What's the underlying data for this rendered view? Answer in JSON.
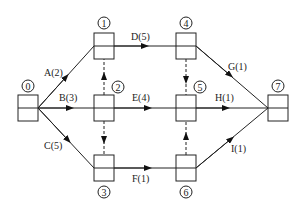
{
  "diagram": {
    "type": "activity-on-node network",
    "nodes": [
      {
        "id": "0",
        "label": "0",
        "x": 18,
        "y": 95
      },
      {
        "id": "1",
        "label": "1",
        "x": 94,
        "y": 33
      },
      {
        "id": "2",
        "label": "2",
        "x": 94,
        "y": 95
      },
      {
        "id": "3",
        "label": "3",
        "x": 94,
        "y": 155
      },
      {
        "id": "4",
        "label": "4",
        "x": 176,
        "y": 33
      },
      {
        "id": "5",
        "label": "5",
        "x": 176,
        "y": 95
      },
      {
        "id": "6",
        "label": "6",
        "x": 176,
        "y": 155
      },
      {
        "id": "7",
        "label": "7",
        "x": 268,
        "y": 95
      }
    ],
    "activities": [
      {
        "label": "A(2)",
        "from": "0",
        "to": "1"
      },
      {
        "label": "B(3)",
        "from": "0",
        "to": "2"
      },
      {
        "label": "C(5)",
        "from": "0",
        "to": "3"
      },
      {
        "label": "D(5)",
        "from": "1",
        "to": "4"
      },
      {
        "label": "E(4)",
        "from": "2",
        "to": "5"
      },
      {
        "label": "F(1)",
        "from": "3",
        "to": "6"
      },
      {
        "label": "G(1)",
        "from": "4",
        "to": "7"
      },
      {
        "label": "H(1)",
        "from": "5",
        "to": "7"
      },
      {
        "label": "I(1)",
        "from": "6",
        "to": "7"
      }
    ],
    "dummies": [
      {
        "from": "2",
        "to": "1"
      },
      {
        "from": "2",
        "to": "3"
      },
      {
        "from": "4",
        "to": "5"
      },
      {
        "from": "6",
        "to": "5"
      }
    ]
  }
}
